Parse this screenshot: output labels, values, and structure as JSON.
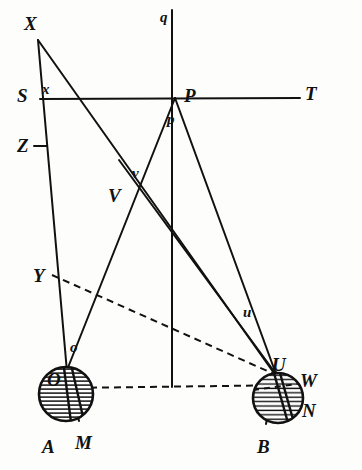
{
  "figure": {
    "kind": "geometric-optics-diagram",
    "width": 362,
    "height": 470,
    "ink_color": "#111111",
    "paper_color": "#fdfdfc",
    "faint_caption": ""
  },
  "labels": {
    "X": {
      "text": "X",
      "x": 24,
      "y": 14,
      "size": "upper"
    },
    "S": {
      "text": "S",
      "x": 17,
      "y": 86,
      "size": "upper"
    },
    "x": {
      "text": "x",
      "x": 42,
      "y": 82,
      "size": "lower"
    },
    "Z": {
      "text": "Z",
      "x": 17,
      "y": 136,
      "size": "upper"
    },
    "q": {
      "text": "q",
      "x": 160,
      "y": 10,
      "size": "lower"
    },
    "P": {
      "text": "P",
      "x": 184,
      "y": 86,
      "size": "upper"
    },
    "p": {
      "text": "p",
      "x": 167,
      "y": 112,
      "size": "lower"
    },
    "T": {
      "text": "T",
      "x": 305,
      "y": 84,
      "size": "upper"
    },
    "v": {
      "text": "v",
      "x": 132,
      "y": 166,
      "size": "lower"
    },
    "V": {
      "text": "V",
      "x": 108,
      "y": 186,
      "size": "upper"
    },
    "Y": {
      "text": "Y",
      "x": 33,
      "y": 266,
      "size": "upper"
    },
    "u": {
      "text": "u",
      "x": 243,
      "y": 305,
      "size": "lower"
    },
    "o": {
      "text": "o",
      "x": 70,
      "y": 340,
      "size": "lower"
    },
    "O": {
      "text": "O",
      "x": 47,
      "y": 370,
      "size": "upper"
    },
    "U": {
      "text": "U",
      "x": 272,
      "y": 355,
      "size": "upper"
    },
    "W": {
      "text": "W",
      "x": 300,
      "y": 371,
      "size": "upper"
    },
    "N": {
      "text": "N",
      "x": 302,
      "y": 401,
      "size": "upper"
    },
    "A": {
      "text": "A",
      "x": 42,
      "y": 437,
      "size": "upper"
    },
    "M": {
      "text": "M",
      "x": 75,
      "y": 433,
      "size": "upper"
    },
    "B": {
      "text": "B",
      "x": 257,
      "y": 437,
      "size": "upper"
    }
  },
  "points": {
    "X": {
      "x": 38,
      "y": 40
    },
    "S": {
      "x": 40,
      "y": 99
    },
    "Zt": {
      "x": 40,
      "y": 146
    },
    "P": {
      "x": 175,
      "y": 98
    },
    "T": {
      "x": 300,
      "y": 98
    },
    "qtop": {
      "x": 172,
      "y": 10
    },
    "qbot": {
      "x": 172,
      "y": 387
    },
    "V": {
      "x": 135,
      "y": 190
    },
    "Y": {
      "x": 52,
      "y": 273
    },
    "o": {
      "x": 67,
      "y": 368
    },
    "U": {
      "x": 276,
      "y": 372
    },
    "Ocen": {
      "x": 66,
      "y": 394
    },
    "Ucen": {
      "x": 278,
      "y": 398
    },
    "M": {
      "x": 79,
      "y": 421
    },
    "A": {
      "x": 52,
      "y": 421
    },
    "B": {
      "x": 266,
      "y": 423
    },
    "W": {
      "x": 300,
      "y": 389
    },
    "N": {
      "x": 299,
      "y": 411
    }
  },
  "circles": {
    "left": {
      "cx": 66,
      "cy": 394,
      "r": 28,
      "hatch": "horizontal",
      "label": "O"
    },
    "right": {
      "cx": 278,
      "cy": 398,
      "r": 26,
      "hatch": "horizontal",
      "label": "U"
    }
  },
  "solid_lines": [
    {
      "name": "X-to-o",
      "x1": 38,
      "y1": 40,
      "x2": 67,
      "y2": 372
    },
    {
      "name": "X-to-U",
      "x1": 38,
      "y1": 40,
      "x2": 276,
      "y2": 376
    },
    {
      "name": "S-T-horizontal",
      "x1": 40,
      "y1": 99,
      "x2": 300,
      "y2": 98
    },
    {
      "name": "q-vertical",
      "x1": 172,
      "y1": 10,
      "x2": 172,
      "y2": 387
    },
    {
      "name": "P-to-o",
      "x1": 175,
      "y1": 98,
      "x2": 67,
      "y2": 370
    },
    {
      "name": "P-to-U",
      "x1": 175,
      "y1": 98,
      "x2": 276,
      "y2": 374
    },
    {
      "name": "V-to-U-upper",
      "x1": 119,
      "y1": 160,
      "x2": 276,
      "y2": 374
    },
    {
      "name": "o-to-M",
      "x1": 67,
      "y1": 368,
      "x2": 79,
      "y2": 421
    },
    {
      "name": "U-to-B",
      "x1": 276,
      "y1": 372,
      "x2": 266,
      "y2": 424
    }
  ],
  "dashed_lines": [
    {
      "name": "Y-to-U-ray",
      "x1": 52,
      "y1": 275,
      "x2": 274,
      "y2": 374
    },
    {
      "name": "O-to-U-baseline",
      "x1": 66,
      "y1": 388,
      "x2": 300,
      "y2": 385
    }
  ],
  "ticks": [
    {
      "name": "Z-tick-mark",
      "x1": 34,
      "y1": 146,
      "x2": 47,
      "y2": 146
    }
  ]
}
